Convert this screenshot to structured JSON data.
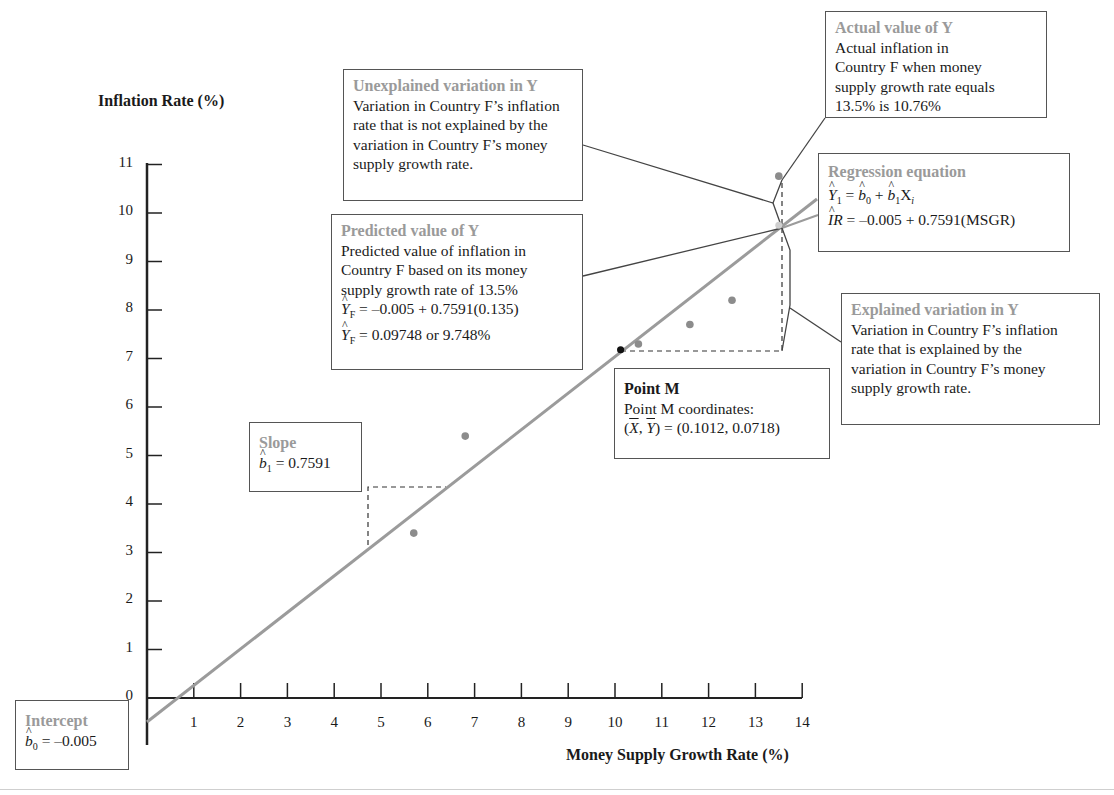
{
  "chart_data": {
    "type": "scatter",
    "title": "",
    "xlabel": "Money Supply Growth Rate (%)",
    "ylabel": "Inflation Rate (%)",
    "xlim": [
      0,
      14
    ],
    "ylim": [
      0,
      11
    ],
    "x_ticks": [
      1,
      2,
      3,
      4,
      5,
      6,
      7,
      8,
      9,
      10,
      11,
      12,
      13,
      14
    ],
    "y_ticks": [
      0,
      1,
      2,
      3,
      4,
      5,
      6,
      7,
      8,
      9,
      10,
      11
    ],
    "grid": false,
    "series": [
      {
        "name": "Countries",
        "points": [
          {
            "x": 5.7,
            "y": 3.4
          },
          {
            "x": 6.8,
            "y": 5.4
          },
          {
            "x": 10.5,
            "y": 7.3
          },
          {
            "x": 11.6,
            "y": 7.7
          },
          {
            "x": 12.5,
            "y": 8.2
          },
          {
            "x": 13.5,
            "y": 10.76
          }
        ]
      },
      {
        "name": "Point M",
        "points": [
          {
            "x": 10.12,
            "y": 7.18
          }
        ]
      },
      {
        "name": "Predicted F",
        "points": [
          {
            "x": 13.5,
            "y": 9.748
          }
        ]
      }
    ],
    "regression_line": {
      "intercept": -0.005,
      "slope": 0.7591,
      "x_range": [
        0,
        14.3
      ]
    },
    "annotations": [
      "Unexplained variation in Y",
      "Predicted value of Y",
      "Actual value of Y",
      "Regression equation",
      "Explained variation in Y",
      "Point M",
      "Slope",
      "Intercept"
    ]
  },
  "axes": {
    "y_title": "Inflation Rate (%)",
    "x_title": "Money Supply Growth Rate (%)",
    "y_ticks": [
      "0",
      "1",
      "2",
      "3",
      "4",
      "5",
      "6",
      "7",
      "8",
      "9",
      "10",
      "11"
    ],
    "x_ticks": [
      "1",
      "2",
      "3",
      "4",
      "5",
      "6",
      "7",
      "8",
      "9",
      "10",
      "11",
      "12",
      "13",
      "14"
    ]
  },
  "colors": {
    "heading_gray": "#9a9a9a",
    "line_gray": "#9b9b9b",
    "point_gray": "#8c8c8c",
    "point_m": "#111111",
    "axis": "#222222"
  },
  "boxes": {
    "unexplained": {
      "heading": "Unexplained variation in Y",
      "lines": [
        "Variation in Country F’s inflation",
        "rate that is not explained by the",
        "variation in Country F’s money",
        "supply growth rate."
      ]
    },
    "predicted": {
      "heading": "Predicted value of Y",
      "lines": [
        "Predicted value of inflation in",
        "Country F based on its money",
        "supply growth rate of 13.5%"
      ],
      "eq1_rhs": " = –0.005 + 0.7591(0.135)",
      "eq2_rhs": " = 0.09748 or 9.748%",
      "y_sym": "Y",
      "sub_f": "F"
    },
    "actual": {
      "heading": "Actual value of Y",
      "lines": [
        "Actual inflation in",
        "Country F when money",
        "supply growth rate equals",
        "13.5% is 10.76%"
      ]
    },
    "regression": {
      "heading": "Regression equation",
      "y_sym": "Y",
      "sub_1": "1",
      "eq_mid": " = ",
      "b_sym": "b",
      "sub_0": "0",
      "plus": " + ",
      "x_sym": "X",
      "sub_i": "i",
      "ir_sym": "IR",
      "eq2_rhs": " = –0.005 + 0.7591(MSGR)"
    },
    "explained": {
      "heading": "Explained variation in Y",
      "lines": [
        "Variation in Country F’s inflation",
        "rate that is explained by the",
        "variation in Country F’s money",
        "supply growth rate."
      ]
    },
    "point_m": {
      "heading": "Point M",
      "line1": "Point M coordinates:",
      "x_sym": "X",
      "y_sym": "Y",
      "coords": " = (0.1012, 0.0718)"
    },
    "slope": {
      "heading": "Slope",
      "b_sym": "b",
      "sub": "1",
      "value": " = 0.7591"
    },
    "intercept": {
      "heading": "Intercept",
      "b_sym": "b",
      "sub": "0",
      "value": " = –0.005"
    }
  }
}
